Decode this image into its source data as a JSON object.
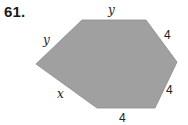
{
  "problem": {
    "number": "61."
  },
  "figure": {
    "shape": "hexagon",
    "fill_color": "#a0a0a0",
    "stroke_color": "#8a8a8a",
    "vertices": [
      [
        36,
        64
      ],
      [
        82,
        20
      ],
      [
        146,
        20
      ],
      [
        177,
        62
      ],
      [
        155,
        108
      ],
      [
        97,
        108
      ]
    ],
    "side_labels": {
      "top": "y",
      "upper_left": "y",
      "upper_right": "4",
      "lower_right": "4",
      "bottom": "4",
      "lower_left": "x"
    }
  }
}
